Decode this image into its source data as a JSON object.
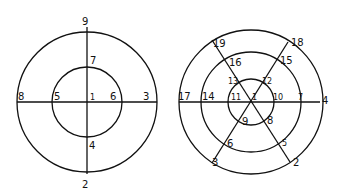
{
  "left_diagram": {
    "description": "Two concentric circles bisected by a vertical and horizontal line",
    "labels": {
      "n1": "1",
      "n2": "2",
      "n3": "3",
      "n4": "4",
      "n5": "5",
      "n6": "6",
      "n7": "7",
      "n8": "8",
      "n9": "9"
    }
  },
  "right_diagram": {
    "description": "Three concentric circles divided by three lines through the center",
    "labels": {
      "n1": "1",
      "n2": "2",
      "n3": "3",
      "n4": "4",
      "n5": "5",
      "n6": "6",
      "n7": "7",
      "n8": "8",
      "n9": "9",
      "n10": "10",
      "n11": "11",
      "n12": "12",
      "n13": "13",
      "n14": "14",
      "n15": "15",
      "n16": "16",
      "n17": "17",
      "n18": "18",
      "n19": "19"
    }
  }
}
